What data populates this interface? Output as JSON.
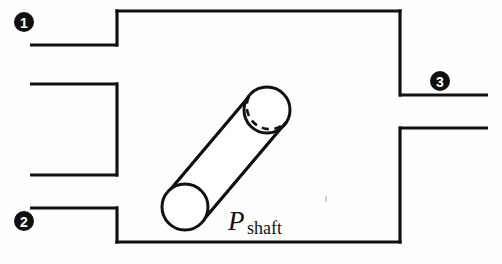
{
  "figure": {
    "background_color": "#fefefe",
    "line_color": "#111111"
  },
  "control_volume": {
    "name": "control-volume-boundary",
    "left": 117,
    "right": 400,
    "top": 11,
    "bottom": 242,
    "stroke_width": 3.2
  },
  "stream_markers": [
    {
      "id": "1",
      "label": "1",
      "role": "inlet",
      "cx": 24,
      "cy": 22,
      "radius": 10
    },
    {
      "id": "2",
      "label": "2",
      "role": "inlet",
      "cx": 24,
      "cy": 221,
      "radius": 10
    },
    {
      "id": "3",
      "label": "3",
      "role": "outlet",
      "cx": 440,
      "cy": 81,
      "radius": 10
    }
  ],
  "ports": [
    {
      "name": "port-stream-1-lower-wall",
      "x1": 30,
      "y1": 45,
      "x2": 118,
      "y2": 45
    },
    {
      "name": "port-middle-upper-wall",
      "x1": 30,
      "y1": 84,
      "x2": 118,
      "y2": 84
    },
    {
      "name": "port-middle-lower-wall",
      "x1": 30,
      "y1": 175,
      "x2": 118,
      "y2": 175
    },
    {
      "name": "port-stream-2-upper-wall",
      "x1": 30,
      "y1": 208,
      "x2": 118,
      "y2": 208
    },
    {
      "name": "port-stream-3-upper-wall",
      "x1": 399,
      "y1": 95,
      "x2": 488,
      "y2": 95
    },
    {
      "name": "port-stream-3-lower-wall",
      "x1": 399,
      "y1": 128,
      "x2": 488,
      "y2": 128
    }
  ],
  "shaft": {
    "name": "rotating-shaft",
    "near_face": {
      "cx": 185,
      "cy": 207,
      "rx": 23,
      "ry": 23
    },
    "far_face": {
      "cx": 267,
      "cy": 110,
      "rx": 23,
      "ry": 23
    },
    "label_main": "P",
    "label_subscript": "shaft",
    "label_x": 228,
    "label_y": 230
  }
}
